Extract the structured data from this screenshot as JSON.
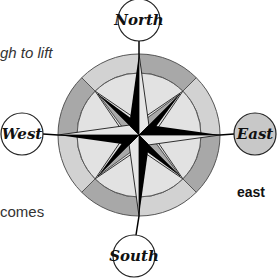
{
  "text_fragments": {
    "top": "gh to lift",
    "bottom": "comes"
  },
  "compass": {
    "labels": {
      "north": "North",
      "east": "East",
      "south": "South",
      "west": "West"
    },
    "caption": "east",
    "highlighted_direction": "east",
    "colors": {
      "ink": "#000000",
      "light_fill": "#e6e6e6",
      "mid_fill": "#d2d2d2",
      "dark_fill": "#a8a8a8",
      "highlight_fill": "#c8c8c8",
      "outline": "#555555"
    }
  }
}
